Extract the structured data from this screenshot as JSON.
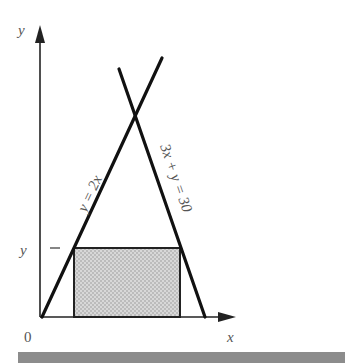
{
  "diagram": {
    "axes": {
      "x_label": "x",
      "y_label": "y",
      "origin_label": "0"
    },
    "lines": [
      {
        "equation": "y = 2x"
      },
      {
        "equation": "3x + y = 30"
      }
    ],
    "rectangle": {
      "height_label": "y",
      "fill": "#cfcfcf"
    },
    "bar_color": "#8c8c8c"
  }
}
